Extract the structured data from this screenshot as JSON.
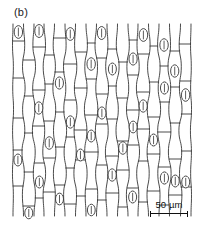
{
  "figure": {
    "panel_label": "(b)",
    "domain": "scientific-line-drawing",
    "background_color": "#ffffff",
    "ink_color": "#2b2b2b",
    "width": 199,
    "height": 228
  },
  "scalebar": {
    "value": "50",
    "unit": "µm",
    "caption": "50 µm",
    "bar_length_px": 38,
    "has_end_caps": true
  },
  "drawing": {
    "plot_area": {
      "x": 13,
      "y": 24,
      "width": 178,
      "height": 192
    },
    "cell_file_count": 17,
    "stomata_count": 34,
    "stroke_width": 0.85,
    "description": "Vertical files of elongated epidermal cells separated by slightly wavy anticlinal walls, interrupted by transverse cross walls and scattered lens-shaped stomata.",
    "column_x": [
      13,
      23.5,
      34,
      44,
      54.5,
      65,
      75.5,
      86,
      96.5,
      107,
      117.5,
      128,
      138,
      148.5,
      159,
      169.5,
      180.5,
      191
    ],
    "columns": [
      {
        "wobble": [
          0,
          -1.4,
          1.1,
          -0.8,
          1.5,
          -1.2,
          0.6,
          -1.5,
          1.0,
          0
        ],
        "cross_walls": [
          41,
          78,
          118,
          150,
          186
        ],
        "stomata": [
          {
            "y": 32,
            "rx": 4.2,
            "ry": 6.4
          },
          {
            "y": 160,
            "rx": 4.0,
            "ry": 6.0
          }
        ]
      },
      {
        "wobble": [
          0,
          1.2,
          -1.0,
          1.6,
          -0.9,
          1.3,
          -1.5,
          0.8,
          -1.1,
          0
        ],
        "cross_walls": [
          60,
          96,
          133,
          172,
          206
        ],
        "stomata": [
          {
            "y": 213,
            "rx": 4.0,
            "ry": 5.8
          }
        ]
      },
      {
        "wobble": [
          0,
          -1.1,
          1.5,
          -1.3,
          0.9,
          -1.6,
          1.2,
          -0.7,
          1.4,
          0
        ],
        "cross_walls": [
          47,
          90,
          126,
          163,
          198
        ],
        "stomata": [
          {
            "y": 31,
            "rx": 4.3,
            "ry": 6.5
          },
          {
            "y": 108,
            "rx": 4.1,
            "ry": 6.2
          },
          {
            "y": 182,
            "rx": 4.0,
            "ry": 6.0
          }
        ]
      },
      {
        "wobble": [
          0,
          1.5,
          -0.8,
          1.1,
          -1.4,
          0.7,
          -1.2,
          1.6,
          -0.9,
          0
        ],
        "cross_walls": [
          55,
          84,
          121,
          158,
          192
        ],
        "stomata": [
          {
            "y": 143,
            "rx": 4.2,
            "ry": 6.3
          }
        ]
      },
      {
        "wobble": [
          0,
          -1.3,
          0.9,
          -1.6,
          1.2,
          -1.0,
          1.4,
          -1.1,
          0.8,
          0
        ],
        "cross_walls": [
          38,
          72,
          112,
          147,
          185
        ],
        "stomata": [
          {
            "y": 83,
            "rx": 4.1,
            "ry": 6.1
          },
          {
            "y": 199,
            "rx": 4.0,
            "ry": 5.9
          }
        ]
      },
      {
        "wobble": [
          0,
          1.1,
          -1.5,
          0.8,
          -1.2,
          1.6,
          -0.9,
          1.3,
          -1.4,
          0
        ],
        "cross_walls": [
          64,
          100,
          137,
          168,
          204
        ],
        "stomata": [
          {
            "y": 34,
            "rx": 4.3,
            "ry": 6.4
          },
          {
            "y": 122,
            "rx": 4.1,
            "ry": 6.2
          }
        ]
      },
      {
        "wobble": [
          0,
          -0.9,
          1.3,
          -1.1,
          1.5,
          -1.4,
          0.7,
          -1.6,
          1.0,
          0
        ],
        "cross_walls": [
          52,
          88,
          130,
          160,
          196
        ],
        "stomata": [
          {
            "y": 155,
            "rx": 4.0,
            "ry": 6.0
          }
        ]
      },
      {
        "wobble": [
          0,
          1.4,
          -1.2,
          1.0,
          -1.6,
          0.9,
          -1.3,
          1.1,
          -0.8,
          0
        ],
        "cross_walls": [
          43,
          79,
          115,
          152,
          189
        ],
        "stomata": [
          {
            "y": 64,
            "rx": 4.2,
            "ry": 6.3
          },
          {
            "y": 136,
            "rx": 4.0,
            "ry": 6.0
          },
          {
            "y": 210,
            "rx": 3.9,
            "ry": 5.8
          }
        ]
      },
      {
        "wobble": [
          0,
          -1.5,
          1.0,
          -0.7,
          1.3,
          -1.1,
          1.6,
          -0.9,
          1.2,
          0
        ],
        "cross_walls": [
          58,
          94,
          124,
          165,
          200
        ],
        "stomata": [
          {
            "y": 33,
            "rx": 4.3,
            "ry": 6.5
          },
          {
            "y": 113,
            "rx": 4.1,
            "ry": 6.1
          }
        ]
      },
      {
        "wobble": [
          0,
          0.9,
          -1.3,
          1.5,
          -1.0,
          1.2,
          -1.6,
          0.8,
          -1.1,
          0
        ],
        "cross_walls": [
          49,
          86,
          119,
          156,
          193
        ],
        "stomata": [
          {
            "y": 69,
            "rx": 4.0,
            "ry": 6.0
          },
          {
            "y": 175,
            "rx": 4.1,
            "ry": 6.2
          }
        ]
      },
      {
        "wobble": [
          0,
          -1.2,
          1.6,
          -1.4,
          0.8,
          -1.5,
          1.1,
          -1.0,
          1.3,
          0
        ],
        "cross_walls": [
          62,
          98,
          141,
          170,
          207
        ],
        "stomata": [
          {
            "y": 148,
            "rx": 4.2,
            "ry": 6.3
          }
        ]
      },
      {
        "wobble": [
          0,
          1.3,
          -1.1,
          0.7,
          -1.5,
          1.4,
          -0.8,
          1.2,
          -1.6,
          0
        ],
        "cross_walls": [
          40,
          75,
          110,
          145,
          188
        ],
        "stomata": [
          {
            "y": 59,
            "rx": 4.1,
            "ry": 6.1
          },
          {
            "y": 127,
            "rx": 4.0,
            "ry": 5.9
          },
          {
            "y": 197,
            "rx": 4.0,
            "ry": 6.0
          }
        ]
      },
      {
        "wobble": [
          0,
          -1.0,
          1.2,
          -1.6,
          1.1,
          -0.9,
          1.5,
          -1.3,
          0.8,
          0
        ],
        "cross_walls": [
          54,
          92,
          129,
          161,
          202
        ],
        "stomata": [
          {
            "y": 35,
            "rx": 4.3,
            "ry": 6.4
          },
          {
            "y": 106,
            "rx": 4.1,
            "ry": 6.2
          }
        ]
      },
      {
        "wobble": [
          0,
          1.6,
          -0.9,
          1.3,
          -1.2,
          1.0,
          -1.4,
          0.7,
          -1.5,
          0
        ],
        "cross_walls": [
          46,
          82,
          117,
          154,
          191
        ],
        "stomata": [
          {
            "y": 140,
            "rx": 4.0,
            "ry": 6.0
          }
        ]
      },
      {
        "wobble": [
          0,
          -1.4,
          1.1,
          -0.8,
          1.6,
          -1.3,
          0.9,
          -1.2,
          1.0,
          0
        ],
        "cross_walls": [
          66,
          102,
          132,
          167,
          205
        ],
        "stomata": [
          {
            "y": 45,
            "rx": 4.2,
            "ry": 6.3
          },
          {
            "y": 88,
            "rx": 4.0,
            "ry": 6.1
          },
          {
            "y": 178,
            "rx": 4.1,
            "ry": 6.1
          }
        ]
      },
      {
        "wobble": [
          0,
          1.0,
          -1.5,
          1.2,
          -0.7,
          1.4,
          -1.1,
          1.6,
          -0.9,
          0
        ],
        "cross_walls": [
          51,
          87,
          123,
          159,
          195
        ],
        "stomata": [
          {
            "y": 71,
            "rx": 4.1,
            "ry": 6.2
          },
          {
            "y": 181,
            "rx": 4.0,
            "ry": 6.0
          }
        ]
      },
      {
        "wobble": [
          0,
          -1.3,
          0.8,
          -1.1,
          1.5,
          -1.6,
          1.2,
          -1.0,
          1.4,
          0
        ],
        "cross_walls": [
          44,
          81,
          114,
          151,
          187
        ],
        "stomata": [
          {
            "y": 95,
            "rx": 4.2,
            "ry": 6.3
          },
          {
            "y": 182,
            "rx": 4.0,
            "ry": 6.0
          }
        ]
      }
    ]
  }
}
